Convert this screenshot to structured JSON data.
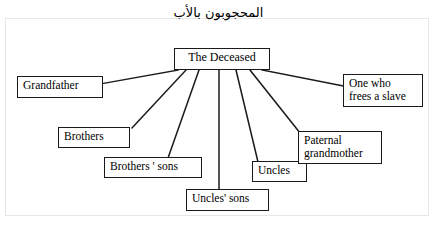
{
  "diagram": {
    "heading": "المحجوبون بالأب",
    "type": "radial-tree",
    "root": {
      "label": "The Deceased"
    },
    "nodes": [
      {
        "id": "grandfather",
        "label": "Grandfather",
        "lines": [
          "Grandfather"
        ]
      },
      {
        "id": "brothers",
        "label": "Brothers",
        "lines": [
          "Brothers"
        ]
      },
      {
        "id": "brothers-sons",
        "label": "Brothers ' sons",
        "lines": [
          "Brothers ' sons"
        ]
      },
      {
        "id": "uncles-sons",
        "label": "Uncles' sons",
        "lines": [
          "Uncles' sons"
        ]
      },
      {
        "id": "uncles",
        "label": "Uncles",
        "lines": [
          "Uncles"
        ]
      },
      {
        "id": "paternal-grandmother",
        "label": "Paternal grandmother",
        "lines": [
          "Paternal",
          "grandmother"
        ]
      },
      {
        "id": "one-who-frees-a-slave",
        "label": "One who frees a slave",
        "lines": [
          "One who",
          "frees a slave"
        ]
      }
    ],
    "colors": {
      "box_border": "#1a1a1a",
      "edge": "#1a1a1a",
      "frame": "#e7e7e7",
      "background": "#ffffff",
      "text": "#000000"
    }
  }
}
